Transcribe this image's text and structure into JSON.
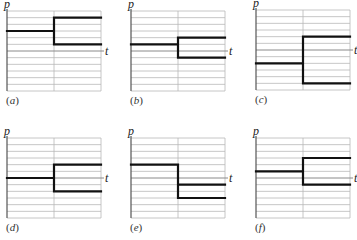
{
  "figure": {
    "y_axis_label": "p",
    "x_axis_label": "t",
    "grid": {
      "divisions": 12,
      "axis_line_index": 6,
      "vertical_divider": "center"
    },
    "colors": {
      "grid": "#b8b8b8",
      "axis": "#8a8a8a",
      "curve": "#111111",
      "frame": "#555555"
    }
  },
  "panels": [
    {
      "id": "a",
      "caption_open": "(",
      "caption_letter": "a",
      "caption_close": ")"
    },
    {
      "id": "b",
      "caption_open": "(",
      "caption_letter": "b",
      "caption_close": ")"
    },
    {
      "id": "c",
      "caption_open": "(",
      "caption_letter": "c",
      "caption_close": ")"
    },
    {
      "id": "d",
      "caption_open": "(",
      "caption_letter": "d",
      "caption_close": ")"
    },
    {
      "id": "e",
      "caption_open": "(",
      "caption_letter": "e",
      "caption_close": ")"
    },
    {
      "id": "f",
      "caption_open": "(",
      "caption_letter": "f",
      "caption_close": ")"
    }
  ],
  "chart_data": [
    {
      "type": "line",
      "title": "(a)",
      "xlabel": "t",
      "ylabel": "p",
      "ylim": [
        -6,
        6
      ],
      "grid": true,
      "series": [
        {
          "name": "before",
          "x": [
            0,
            0.5
          ],
          "values": [
            3,
            3
          ]
        },
        {
          "name": "after-upper",
          "x": [
            0.5,
            1
          ],
          "values": [
            5,
            5
          ]
        },
        {
          "name": "after-lower",
          "x": [
            0.5,
            1
          ],
          "values": [
            1,
            1
          ]
        }
      ]
    },
    {
      "type": "line",
      "title": "(b)",
      "xlabel": "t",
      "ylabel": "p",
      "ylim": [
        -6,
        6
      ],
      "grid": true,
      "series": [
        {
          "name": "before",
          "x": [
            0,
            0.5
          ],
          "values": [
            1,
            1
          ]
        },
        {
          "name": "after-upper",
          "x": [
            0.5,
            1
          ],
          "values": [
            2,
            2
          ]
        },
        {
          "name": "after-lower",
          "x": [
            0.5,
            1
          ],
          "values": [
            -1,
            -1
          ]
        }
      ]
    },
    {
      "type": "line",
      "title": "(c)",
      "xlabel": "t",
      "ylabel": "p",
      "ylim": [
        -6,
        6
      ],
      "grid": true,
      "series": [
        {
          "name": "before",
          "x": [
            0,
            0.5
          ],
          "values": [
            -2,
            -2
          ]
        },
        {
          "name": "after-upper",
          "x": [
            0.5,
            1
          ],
          "values": [
            2,
            2
          ]
        },
        {
          "name": "after-lower",
          "x": [
            0.5,
            1
          ],
          "values": [
            -5,
            -5
          ]
        }
      ]
    },
    {
      "type": "line",
      "title": "(d)",
      "xlabel": "t",
      "ylabel": "p",
      "ylim": [
        -6,
        6
      ],
      "grid": true,
      "series": [
        {
          "name": "before",
          "x": [
            0,
            0.5
          ],
          "values": [
            0,
            0
          ]
        },
        {
          "name": "after-upper",
          "x": [
            0.5,
            1
          ],
          "values": [
            2,
            2
          ]
        },
        {
          "name": "after-lower",
          "x": [
            0.5,
            1
          ],
          "values": [
            -2,
            -2
          ]
        }
      ]
    },
    {
      "type": "line",
      "title": "(e)",
      "xlabel": "t",
      "ylabel": "p",
      "ylim": [
        -6,
        6
      ],
      "grid": true,
      "series": [
        {
          "name": "before",
          "x": [
            0,
            0.5
          ],
          "values": [
            2,
            2
          ]
        },
        {
          "name": "after-upper",
          "x": [
            0.5,
            1
          ],
          "values": [
            -1,
            -1
          ]
        },
        {
          "name": "after-lower",
          "x": [
            0.5,
            1
          ],
          "values": [
            -3,
            -3
          ]
        }
      ]
    },
    {
      "type": "line",
      "title": "(f)",
      "xlabel": "t",
      "ylabel": "p",
      "ylim": [
        -6,
        6
      ],
      "grid": true,
      "series": [
        {
          "name": "before",
          "x": [
            0,
            0.5
          ],
          "values": [
            1,
            1
          ]
        },
        {
          "name": "after-upper",
          "x": [
            0.5,
            1
          ],
          "values": [
            3,
            3
          ]
        },
        {
          "name": "after-lower",
          "x": [
            0.5,
            1
          ],
          "values": [
            -1,
            -1
          ]
        }
      ]
    }
  ]
}
